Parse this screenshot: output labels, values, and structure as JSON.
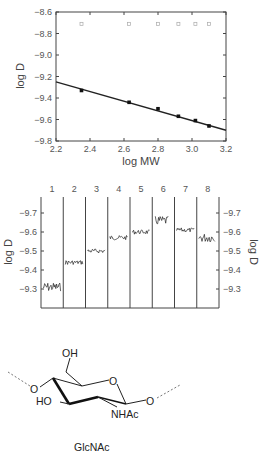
{
  "chart_data": [
    {
      "type": "scatter",
      "title": "",
      "xlabel": "log MW",
      "ylabel": "log D",
      "xlim": [
        2.2,
        3.2
      ],
      "ylim": [
        -9.8,
        -8.6
      ],
      "xticks": [
        "2.2",
        "2.4",
        "2.6",
        "2.8",
        "3.0",
        "3.2"
      ],
      "yticks": [
        "-8.6",
        "-8.8",
        "-9.0",
        "-9.2",
        "-9.4",
        "-9.6",
        "-9.8"
      ],
      "grid": false,
      "series": [
        {
          "name": "measured",
          "x": [
            2.35,
            2.63,
            2.8,
            2.92,
            3.02,
            3.1
          ],
          "y": [
            -9.33,
            -9.44,
            -9.5,
            -9.57,
            -9.61,
            -9.66
          ]
        },
        {
          "name": "fit",
          "x": [
            2.2,
            3.2
          ],
          "y": [
            -9.25,
            -9.7
          ]
        },
        {
          "name": "open markers (top)",
          "x": [
            2.35,
            2.63,
            2.8,
            2.92,
            3.02,
            3.1
          ],
          "y": [
            -8.71,
            -8.71,
            -8.71,
            -8.71,
            -8.71,
            -8.71
          ]
        }
      ]
    },
    {
      "type": "line",
      "title": "",
      "xlabel": "",
      "ylabel": "log D",
      "ylabel_right": "log D",
      "y_inverted": true,
      "ylim": [
        -9.2,
        -9.78
      ],
      "yticks": [
        "-9.7",
        "-9.6",
        "-9.5",
        "-9.4",
        "-9.3"
      ],
      "categories": [
        "1",
        "2",
        "3",
        "4",
        "5",
        "6",
        "7",
        "8"
      ],
      "values": [
        -9.31,
        -9.44,
        -9.5,
        -9.57,
        -9.6,
        -9.66,
        -9.61,
        -9.57
      ],
      "grid": false
    }
  ],
  "structure": {
    "labels": {
      "oh_top": "OH",
      "o_ring": "O",
      "o_left": "O",
      "ho": "HO",
      "nhac": "NHAc",
      "o_right": "O"
    },
    "caption": "GlcNAc"
  }
}
